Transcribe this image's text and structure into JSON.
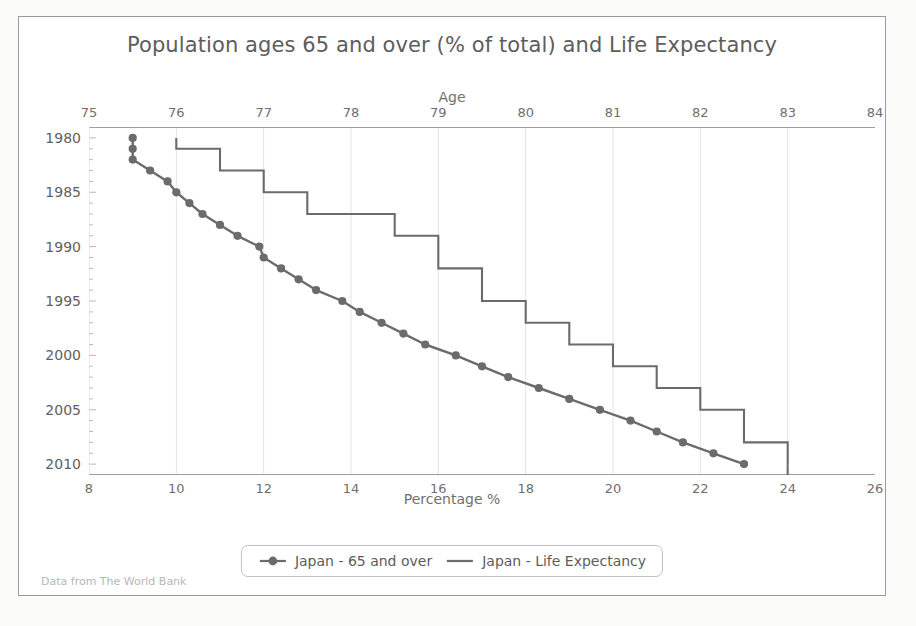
{
  "footer": {
    "text": "Data from The World Bank"
  },
  "legend": {
    "items": [
      {
        "label": "Japan - 65 and over",
        "style": "line-marker",
        "color": "#6b6b6b"
      },
      {
        "label": "Japan - Life Expectancy",
        "style": "line",
        "color": "#6b6b6b"
      }
    ]
  },
  "chart_data": {
    "type": "line",
    "title": "Population ages 65 and over (% of total) and Life Expectancy",
    "xlabel": "Percentage %",
    "ylabel": "",
    "top_axis_label": "Age",
    "grid": true,
    "legend_position": "bottom",
    "orientation": "y-down",
    "y": [
      1980,
      1981,
      1982,
      1983,
      1984,
      1985,
      1986,
      1987,
      1988,
      1989,
      1990,
      1991,
      1992,
      1993,
      1994,
      1995,
      1996,
      1997,
      1998,
      1999,
      2000,
      2001,
      2002,
      2003,
      2004,
      2005,
      2006,
      2007,
      2008,
      2009,
      2010
    ],
    "ylim": [
      1979,
      2011
    ],
    "yticks": [
      1980,
      1985,
      1990,
      1995,
      2000,
      2005,
      2010
    ],
    "xlim": [
      8,
      26
    ],
    "xticks": [
      8,
      10,
      12,
      14,
      16,
      18,
      20,
      22,
      24,
      26
    ],
    "top_xlim": [
      75,
      84
    ],
    "top_xticks": [
      75,
      76,
      77,
      78,
      79,
      80,
      81,
      82,
      83,
      84
    ],
    "series": [
      {
        "name": "Japan - 65 and over",
        "axis": "bottom",
        "unit": "%",
        "color": "#6b6b6b",
        "marker": "circle",
        "values": [
          9.0,
          9.0,
          9.0,
          9.4,
          9.8,
          10.0,
          10.3,
          10.6,
          11.0,
          11.4,
          11.9,
          12.0,
          12.4,
          12.8,
          13.2,
          13.8,
          14.2,
          14.7,
          15.2,
          15.7,
          16.4,
          17.0,
          17.6,
          18.3,
          19.0,
          19.7,
          20.4,
          21.0,
          21.6,
          22.3,
          23.0
        ]
      },
      {
        "name": "Japan - Life Expectancy",
        "axis": "top",
        "unit": "years",
        "color": "#6b6b6b",
        "marker": "none",
        "step": true,
        "values": [
          76.0,
          76.0,
          76.5,
          76.5,
          77.0,
          77.0,
          77.5,
          77.5,
          78.5,
          78.5,
          79.0,
          79.0,
          79.0,
          79.5,
          79.5,
          79.5,
          80.0,
          80.0,
          80.5,
          80.5,
          81.0,
          81.0,
          81.5,
          81.5,
          82.0,
          82.0,
          82.5,
          82.5,
          82.5,
          83.0,
          83.0
        ]
      }
    ]
  }
}
